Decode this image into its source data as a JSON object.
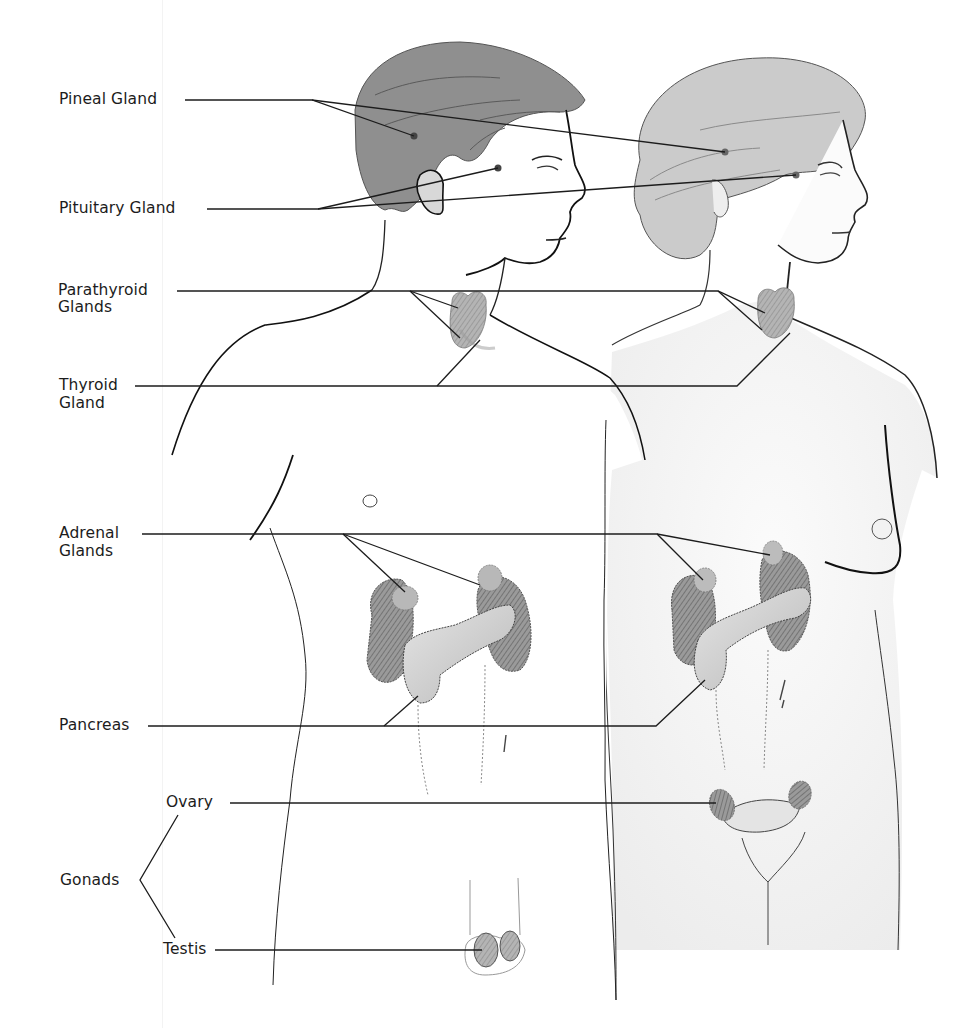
{
  "figure": {
    "colors": {
      "background": "#ffffff",
      "line": "#1c1c1c",
      "hair_male": "#8e8e8e",
      "hair_female": "#c9c9c9",
      "gland_dark": "#7a7a7a",
      "gland_light": "#bdbdbd",
      "skin_shade": "#f1f1f1"
    }
  },
  "labels": {
    "pineal": "Pineal Gland",
    "pituitary": "Pituitary Gland",
    "parathyroid_1": "Parathyroid",
    "parathyroid_2": "Glands",
    "thyroid_1": "Thyroid",
    "thyroid_2": "Gland",
    "adrenal_1": "Adrenal",
    "adrenal_2": "Glands",
    "pancreas": "Pancreas",
    "ovary": "Ovary",
    "gonads": "Gonads",
    "testis": "Testis"
  }
}
